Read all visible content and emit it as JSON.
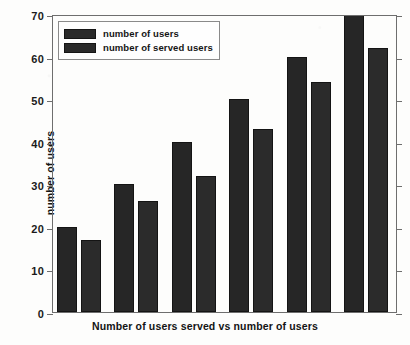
{
  "chart_data": {
    "type": "bar",
    "title": "",
    "xlabel": "Number of users served vs number of users",
    "ylabel": "number of users",
    "categories": [
      "1",
      "2",
      "3",
      "4",
      "5",
      "6"
    ],
    "xtick_labels": [],
    "ylim": [
      0,
      70
    ],
    "ytick_values": [
      0,
      10,
      20,
      30,
      40,
      50,
      60,
      70
    ],
    "ytick_labels": [
      "0",
      "10",
      "20",
      "30",
      "40",
      "50",
      "60",
      "70"
    ],
    "grid": false,
    "legend_position": "upper left",
    "series": [
      {
        "name": "number of users",
        "color": "#262626",
        "values": [
          20,
          30,
          40,
          50,
          60,
          70
        ]
      },
      {
        "name": "number of served users",
        "color": "#2b2b2b",
        "values": [
          17,
          26,
          32,
          43,
          54,
          62
        ]
      }
    ]
  },
  "legend": {
    "items": [
      {
        "label": "number of users"
      },
      {
        "label": "number of served users"
      }
    ]
  },
  "colors": {
    "background": "#fdfdfc",
    "axis": "#6e6e6e",
    "bar_primary": "#262626",
    "bar_secondary": "#2b2b2b",
    "text": "#141414"
  }
}
